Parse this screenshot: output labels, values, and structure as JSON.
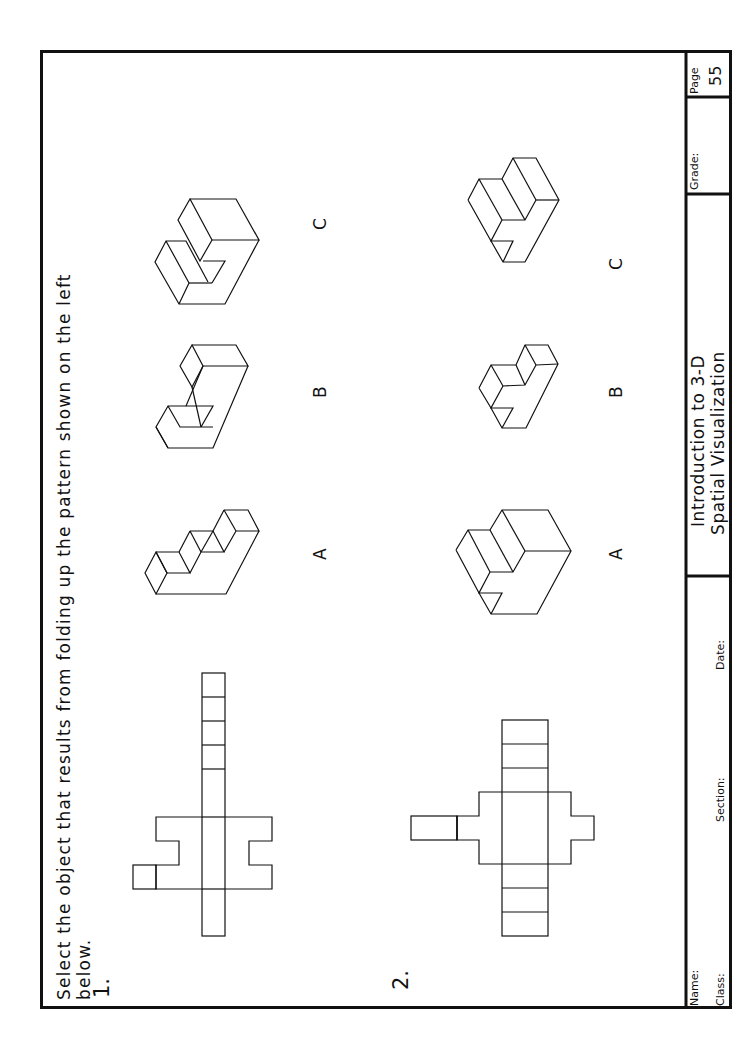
{
  "worksheet": {
    "instruction_line1": "Select the object that results from folding up the pattern shown on the left",
    "instruction_line2": "below.",
    "problems": [
      {
        "number": "1.",
        "pattern": "cross-shaped net with long strip and side tabs",
        "options": [
          {
            "label": "A",
            "shape": "stepped staircase block"
          },
          {
            "label": "B",
            "shape": "L-shaped block with notch"
          },
          {
            "label": "C",
            "shape": "large hooked block"
          }
        ]
      },
      {
        "number": "2.",
        "pattern": "cross-shaped net with side tab",
        "options": [
          {
            "label": "A",
            "shape": "large stepped block with corner notch"
          },
          {
            "label": "B",
            "shape": "small stepped block with notch"
          },
          {
            "label": "C",
            "shape": "stepped block with notch"
          }
        ]
      }
    ]
  },
  "title_block": {
    "name_label": "Name:",
    "class_label": "Class:",
    "section_label": "Section:",
    "date_label": "Date:",
    "course_line1": "Introduction to 3-D",
    "course_line2": "Spatial Visualization",
    "grade_label": "Grade:",
    "page_label": "Page",
    "page_number": "55"
  }
}
